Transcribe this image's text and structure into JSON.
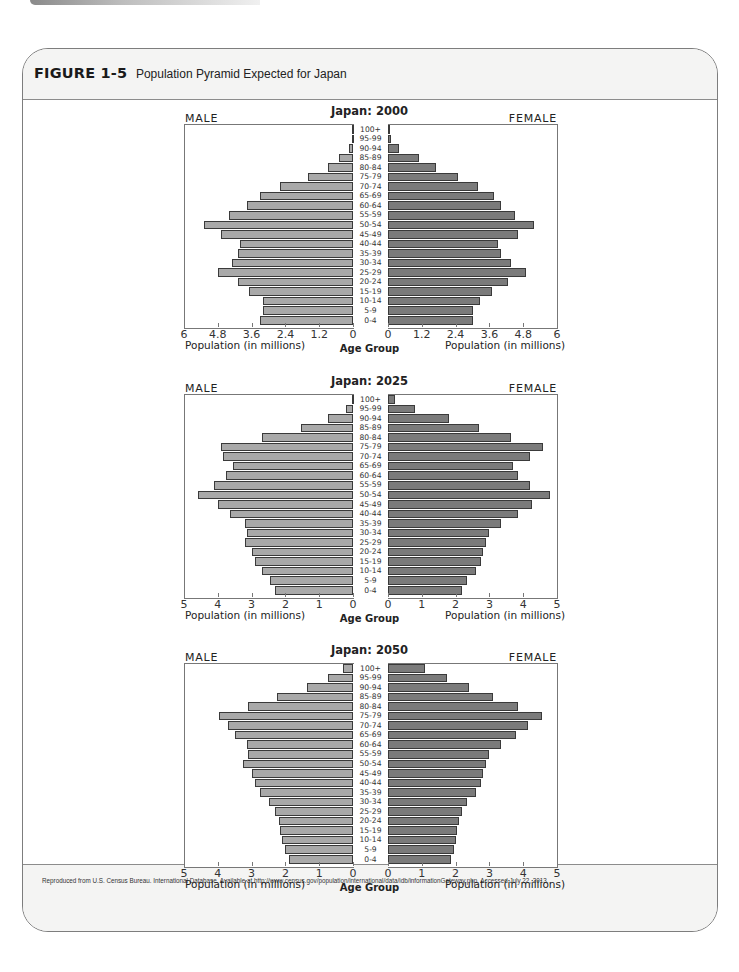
{
  "figure": {
    "number": "FIGURE 1-5",
    "title": "Population Pyramid Expected for Japan",
    "source": "Reproduced from U.S. Census Bureau. International Database. Available at http://www.census.gov/population/international/data/idb/informationGateway.php. Accessed July 22, 2013."
  },
  "labels": {
    "male": "MALE",
    "female": "FEMALE",
    "x_axis": "Population (in millions)",
    "age_axis": "Age Group"
  },
  "colors": {
    "male_bar": "#a9a9a9",
    "female_bar": "#7b7b7b",
    "bar_outline": "#3a3a3a"
  },
  "chart_data": [
    {
      "type": "bar",
      "subtype": "population-pyramid",
      "title": "Japan: 2000",
      "xlabel": "Population (in millions)",
      "ylabel": "Age Group",
      "xlim": [
        0,
        6
      ],
      "ticks": [
        "6",
        "4.8",
        "3.6",
        "2.4",
        "1.2",
        "0"
      ],
      "ticks_female": [
        "0",
        "1.2",
        "2.4",
        "3.6",
        "4.8",
        "6"
      ],
      "categories": [
        "100+",
        "95-99",
        "90-94",
        "85-89",
        "80-84",
        "75-79",
        "70-74",
        "65-69",
        "60-64",
        "55-59",
        "50-54",
        "45-49",
        "40-44",
        "35-39",
        "30-34",
        "25-29",
        "20-24",
        "15-19",
        "10-14",
        "5-9",
        "0-4"
      ],
      "series": [
        {
          "name": "MALE",
          "values": [
            0.02,
            0.05,
            0.15,
            0.5,
            0.9,
            1.6,
            2.6,
            3.3,
            3.75,
            4.4,
            5.3,
            4.7,
            4.0,
            4.1,
            4.3,
            4.8,
            4.1,
            3.7,
            3.2,
            3.2,
            3.3
          ]
        },
        {
          "name": "FEMALE",
          "values": [
            0.03,
            0.1,
            0.4,
            1.1,
            1.7,
            2.5,
            3.2,
            3.75,
            4.0,
            4.5,
            5.2,
            4.6,
            3.9,
            4.0,
            4.35,
            4.9,
            4.25,
            3.7,
            3.25,
            3.0,
            3.0
          ]
        }
      ],
      "legend": [
        "MALE",
        "FEMALE"
      ],
      "grid": false
    },
    {
      "type": "bar",
      "subtype": "population-pyramid",
      "title": "Japan: 2025",
      "xlabel": "Population (in millions)",
      "ylabel": "Age Group",
      "xlim": [
        0,
        5
      ],
      "ticks": [
        "5",
        "4",
        "3",
        "2",
        "1",
        "0"
      ],
      "ticks_female": [
        "0",
        "1",
        "2",
        "3",
        "4",
        "5"
      ],
      "categories": [
        "100+",
        "95-99",
        "90-94",
        "85-89",
        "80-84",
        "75-79",
        "70-74",
        "65-69",
        "60-64",
        "55-59",
        "50-54",
        "45-49",
        "40-44",
        "35-39",
        "30-34",
        "25-29",
        "20-24",
        "15-19",
        "10-14",
        "5-9",
        "0-4"
      ],
      "series": [
        {
          "name": "MALE",
          "values": [
            0.03,
            0.2,
            0.75,
            1.55,
            2.7,
            3.9,
            3.85,
            3.55,
            3.75,
            4.1,
            4.6,
            4.0,
            3.65,
            3.2,
            3.15,
            3.2,
            3.0,
            2.9,
            2.7,
            2.45,
            2.3
          ]
        },
        {
          "name": "FEMALE",
          "values": [
            0.2,
            0.8,
            1.8,
            2.7,
            3.65,
            4.6,
            4.2,
            3.7,
            3.85,
            4.2,
            4.8,
            4.25,
            3.85,
            3.35,
            3.0,
            2.9,
            2.8,
            2.75,
            2.6,
            2.35,
            2.2
          ]
        }
      ],
      "legend": [
        "MALE",
        "FEMALE"
      ],
      "grid": false
    },
    {
      "type": "bar",
      "subtype": "population-pyramid",
      "title": "Japan: 2050",
      "xlabel": "Population (in millions)",
      "ylabel": "Age Group",
      "xlim": [
        0,
        5
      ],
      "ticks": [
        "5",
        "4",
        "3",
        "2",
        "1",
        "0"
      ],
      "ticks_female": [
        "0",
        "1",
        "2",
        "3",
        "4",
        "5"
      ],
      "categories": [
        "100+",
        "95-99",
        "90-94",
        "85-89",
        "80-84",
        "75-79",
        "70-74",
        "65-69",
        "60-64",
        "55-59",
        "50-54",
        "45-49",
        "40-44",
        "35-39",
        "30-34",
        "25-29",
        "20-24",
        "15-19",
        "10-14",
        "5-9",
        "0-4"
      ],
      "series": [
        {
          "name": "MALE",
          "values": [
            0.3,
            0.75,
            1.35,
            2.25,
            3.1,
            3.95,
            3.7,
            3.5,
            3.15,
            3.1,
            3.25,
            3.0,
            2.9,
            2.75,
            2.5,
            2.3,
            2.2,
            2.15,
            2.1,
            2.0,
            1.9
          ]
        },
        {
          "name": "FEMALE",
          "values": [
            1.1,
            1.75,
            2.4,
            3.1,
            3.85,
            4.55,
            4.15,
            3.8,
            3.35,
            3.0,
            2.9,
            2.8,
            2.75,
            2.6,
            2.35,
            2.2,
            2.1,
            2.05,
            2.0,
            1.95,
            1.85
          ]
        }
      ],
      "legend": [
        "MALE",
        "FEMALE"
      ],
      "grid": false
    }
  ]
}
